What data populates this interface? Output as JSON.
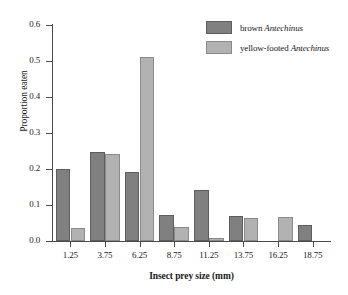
{
  "chart_data": {
    "type": "bar",
    "title": "",
    "subtitle": "",
    "xlabel": "Insect prey size (mm)",
    "ylabel": "Proportion eaten",
    "categories": [
      "1.25",
      "3.75",
      "6.25",
      "8.75",
      "11.25",
      "13.75",
      "16.25",
      "18.75"
    ],
    "series": [
      {
        "name": "brown Antechinus",
        "name_prefix": "brown ",
        "name_species": "Antechinus",
        "color": "#808080",
        "values": [
          0.201,
          0.248,
          0.192,
          0.073,
          0.143,
          0.07,
          null,
          0.045
        ]
      },
      {
        "name": "yellow-footed Antechinus",
        "name_prefix": "yellow-footed ",
        "name_species": "Antechinus",
        "color": "#b2b2b2",
        "values": [
          0.037,
          0.242,
          0.511,
          0.038,
          0.009,
          0.065,
          0.066,
          null
        ]
      }
    ],
    "ylim": [
      0.0,
      0.6
    ],
    "ytick_labels": [
      "0.0",
      "0.1",
      "0.2",
      "0.3",
      "0.4",
      "0.5",
      "0.6"
    ],
    "ytick_values": [
      0.0,
      0.1,
      0.2,
      0.3,
      0.4,
      0.5,
      0.6
    ],
    "grid": false,
    "legend_position": "top-right"
  },
  "legend": {
    "entries": [
      {
        "prefix": "brown ",
        "species": "Antechinus"
      },
      {
        "prefix": "yellow-footed ",
        "species": "Antechinus"
      }
    ]
  }
}
